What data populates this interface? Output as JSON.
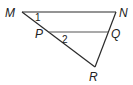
{
  "diagram": {
    "type": "triangle-with-parallel-segment",
    "points": {
      "M": {
        "label": "M",
        "x": 22,
        "y": 12
      },
      "N": {
        "label": "N",
        "x": 116,
        "y": 12
      },
      "P": {
        "label": "P",
        "x": 48,
        "y": 33
      },
      "Q": {
        "label": "Q",
        "x": 108,
        "y": 33
      },
      "R": {
        "label": "R",
        "x": 95,
        "y": 67
      }
    },
    "segments": [
      "MN",
      "MR",
      "NR",
      "PQ"
    ],
    "angles": [
      {
        "label": "1",
        "vertex": "M"
      },
      {
        "label": "2",
        "vertex": "P"
      }
    ],
    "colors": {
      "line": "#2a2a2a",
      "text": "#222222"
    }
  }
}
